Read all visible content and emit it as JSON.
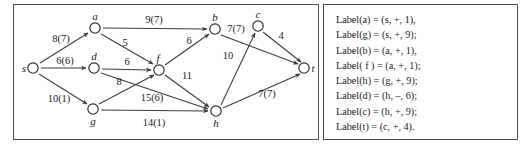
{
  "diagram": {
    "type": "flow-network-graph",
    "nodes": [
      {
        "id": "s",
        "label": "s",
        "x": 19,
        "y": 63,
        "label_dx": -9,
        "label_dy": 4
      },
      {
        "id": "a",
        "label": "a",
        "x": 81,
        "y": 23,
        "label_dx": 0,
        "label_dy": -8
      },
      {
        "id": "d",
        "label": "d",
        "x": 80,
        "y": 63,
        "label_dx": 0,
        "label_dy": -8
      },
      {
        "id": "g",
        "label": "g",
        "x": 79,
        "y": 104,
        "label_dx": 0,
        "label_dy": 16
      },
      {
        "id": "f",
        "label": "f",
        "x": 145,
        "y": 65,
        "label_dx": -1,
        "label_dy": -8
      },
      {
        "id": "b",
        "label": "b",
        "x": 201,
        "y": 24,
        "label_dx": 0,
        "label_dy": -8
      },
      {
        "id": "c",
        "label": "c",
        "x": 244,
        "y": 21,
        "label_dx": 0,
        "label_dy": -8
      },
      {
        "id": "h",
        "label": "h",
        "x": 202,
        "y": 106,
        "label_dx": 0,
        "label_dy": 16
      },
      {
        "id": "t",
        "label": "t",
        "x": 290,
        "y": 63,
        "label_dx": 9,
        "label_dy": 4
      }
    ],
    "edges": [
      {
        "from": "s",
        "to": "a",
        "label": "8(7)",
        "lx": 47,
        "ly": 37
      },
      {
        "from": "s",
        "to": "d",
        "label": "6(6)",
        "lx": 51,
        "ly": 58
      },
      {
        "from": "s",
        "to": "g",
        "label": "10(1)",
        "lx": 45,
        "ly": 96
      },
      {
        "from": "a",
        "to": "b",
        "label": "9(7)",
        "lx": 140,
        "ly": 17
      },
      {
        "from": "a",
        "to": "f",
        "label": "5",
        "lx": 111,
        "ly": 40
      },
      {
        "from": "d",
        "to": "f",
        "label": "6",
        "lx": 113,
        "ly": 59
      },
      {
        "from": "d",
        "to": "h",
        "label": "15(6)",
        "lx": 138,
        "ly": 95
      },
      {
        "from": "g",
        "to": "f",
        "label": "8",
        "lx": 105,
        "ly": 79
      },
      {
        "from": "g",
        "to": "h",
        "label": "14(1)",
        "lx": 140,
        "ly": 120
      },
      {
        "from": "f",
        "to": "b",
        "label": "6",
        "lx": 175,
        "ly": 38
      },
      {
        "from": "f",
        "to": "h",
        "label": "11",
        "lx": 173,
        "ly": 73
      },
      {
        "from": "b",
        "to": "t",
        "label": "10",
        "lx": 214,
        "ly": 53
      },
      {
        "from": "h",
        "to": "c",
        "label": "7(7)",
        "lx": 222,
        "ly": 26
      },
      {
        "from": "c",
        "to": "t",
        "label": "4",
        "lx": 267,
        "ly": 33
      },
      {
        "from": "h",
        "to": "t",
        "label": "7(7)",
        "lx": 253,
        "ly": 91
      }
    ],
    "colors": {
      "node_stroke": "#2b2b2b",
      "edge_stroke": "#3c3c3c",
      "text": "#1a1a1a",
      "panel_border": "#4c4c4c",
      "background": "#ffffff"
    }
  },
  "labels_panel": {
    "lines": [
      "Label(a) = (s, +, 1),",
      "Label(g) = (s, +, 9);",
      "Label(b) = (a, +, 1),",
      "Label( f ) = (a, +, 1);",
      "Label(h) = (g, +, 9);",
      "Label(d) = (h, –, 6);",
      "Label(c) = (h, +, 9);",
      "Label(t) = (c, +, 4)."
    ]
  }
}
